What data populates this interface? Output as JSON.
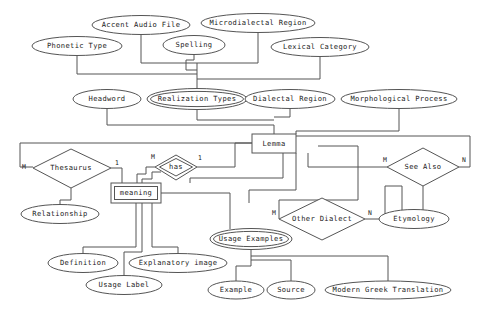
{
  "diagram": {
    "type": "entity-relationship-diagram",
    "stroke_color": "#555555",
    "text_color": "#222222",
    "background_color": "#ffffff",
    "entities": [
      {
        "id": "lemma",
        "label": "Lemma",
        "shape": "rectangle",
        "kind": "strong-entity",
        "x": 274,
        "y": 143,
        "w": 44,
        "h": 19
      },
      {
        "id": "meaning",
        "label": "meaning",
        "shape": "double-rectangle",
        "kind": "weak-entity",
        "x": 136,
        "y": 193,
        "w": 50,
        "h": 20
      }
    ],
    "relationships": [
      {
        "id": "thesaurus",
        "label": "Thesaurus",
        "shape": "diamond",
        "kind": "relationship",
        "x": 71,
        "y": 168,
        "w": 80,
        "h": 38
      },
      {
        "id": "has",
        "label": "has",
        "shape": "double-diamond",
        "kind": "identifying-relationship",
        "x": 176,
        "y": 167,
        "w": 42,
        "h": 25
      },
      {
        "id": "see-also",
        "label": "See Also",
        "shape": "diamond",
        "kind": "relationship",
        "x": 423,
        "y": 167,
        "w": 72,
        "h": 38
      },
      {
        "id": "other-dialect",
        "label": "Other Dialect",
        "shape": "diamond",
        "kind": "relationship",
        "x": 322,
        "y": 219,
        "w": 86,
        "h": 42
      }
    ],
    "attributes": [
      {
        "id": "accent-audio-file",
        "label": "Accent Audio File",
        "shape": "ellipse",
        "kind": "attribute",
        "x": 141,
        "y": 25,
        "w": 98,
        "h": 19
      },
      {
        "id": "microdialectal-region",
        "label": "Microdialectal Region",
        "shape": "ellipse",
        "kind": "attribute",
        "x": 258,
        "y": 23,
        "w": 114,
        "h": 19
      },
      {
        "id": "phonetic-type",
        "label": "Phonetic Type",
        "shape": "ellipse",
        "kind": "attribute",
        "x": 77,
        "y": 46,
        "w": 90,
        "h": 19
      },
      {
        "id": "spelling",
        "label": "Spelling",
        "shape": "ellipse",
        "kind": "attribute",
        "x": 194,
        "y": 45,
        "w": 62,
        "h": 19
      },
      {
        "id": "lexical-category",
        "label": "Lexical Category",
        "shape": "ellipse",
        "kind": "attribute",
        "x": 320,
        "y": 47,
        "w": 98,
        "h": 19
      },
      {
        "id": "headword",
        "label": "Headword",
        "shape": "ellipse",
        "kind": "attribute",
        "x": 107,
        "y": 99,
        "w": 68,
        "h": 19
      },
      {
        "id": "realization-types",
        "label": "Realization Types",
        "shape": "double-ellipse",
        "kind": "multivalued-attribute",
        "x": 196,
        "y": 99,
        "w": 100,
        "h": 20
      },
      {
        "id": "dialectal-region",
        "label": "Dialectal Region",
        "shape": "ellipse",
        "kind": "attribute",
        "x": 290,
        "y": 99,
        "w": 90,
        "h": 19
      },
      {
        "id": "morphological-process",
        "label": "Morphological Process",
        "shape": "ellipse",
        "kind": "attribute",
        "x": 399,
        "y": 99,
        "w": 116,
        "h": 19
      },
      {
        "id": "relationship",
        "label": "Relationship",
        "shape": "ellipse",
        "kind": "attribute",
        "x": 60,
        "y": 214,
        "w": 78,
        "h": 19
      },
      {
        "id": "etymology",
        "label": "Etymology",
        "shape": "ellipse",
        "kind": "attribute",
        "x": 414,
        "y": 219,
        "w": 70,
        "h": 19
      },
      {
        "id": "usage-examples",
        "label": "Usage Examples",
        "shape": "double-ellipse",
        "kind": "multivalued-attribute",
        "x": 251,
        "y": 239,
        "w": 82,
        "h": 20
      },
      {
        "id": "definition",
        "label": "Definition",
        "shape": "ellipse",
        "kind": "attribute",
        "x": 83,
        "y": 263,
        "w": 70,
        "h": 19
      },
      {
        "id": "explanatory-image",
        "label": "Explanatory image",
        "shape": "ellipse",
        "kind": "attribute",
        "x": 178,
        "y": 263,
        "w": 98,
        "h": 19
      },
      {
        "id": "usage-label",
        "label": "Usage Label",
        "shape": "ellipse",
        "kind": "attribute",
        "x": 124,
        "y": 285,
        "w": 76,
        "h": 19
      },
      {
        "id": "example",
        "label": "Example",
        "shape": "ellipse",
        "kind": "attribute",
        "x": 236,
        "y": 290,
        "w": 56,
        "h": 18
      },
      {
        "id": "source",
        "label": "Source",
        "shape": "ellipse",
        "kind": "attribute",
        "x": 291,
        "y": 290,
        "w": 48,
        "h": 18
      },
      {
        "id": "modern-greek-translation",
        "label": "Modern Greek Translation",
        "shape": "ellipse",
        "kind": "attribute",
        "x": 388,
        "y": 290,
        "w": 126,
        "h": 18
      }
    ],
    "cardinality_labels": [
      {
        "id": "thesaurus-m",
        "text": "M",
        "x": 24,
        "y": 167,
        "relationship": "thesaurus"
      },
      {
        "id": "thesaurus-1",
        "text": "1",
        "x": 117,
        "y": 163,
        "relationship": "thesaurus"
      },
      {
        "id": "has-m",
        "text": "M",
        "x": 153,
        "y": 157,
        "relationship": "has"
      },
      {
        "id": "has-1",
        "text": "1",
        "x": 200,
        "y": 158,
        "relationship": "has"
      },
      {
        "id": "see-also-m",
        "text": "M",
        "x": 385,
        "y": 160,
        "relationship": "see-also"
      },
      {
        "id": "see-also-n",
        "text": "N",
        "x": 464,
        "y": 160,
        "relationship": "see-also"
      },
      {
        "id": "other-dialect-m",
        "text": "M",
        "x": 274,
        "y": 213,
        "relationship": "other-dialect"
      },
      {
        "id": "other-dialect-n",
        "text": "N",
        "x": 370,
        "y": 213,
        "relationship": "other-dialect"
      }
    ]
  }
}
